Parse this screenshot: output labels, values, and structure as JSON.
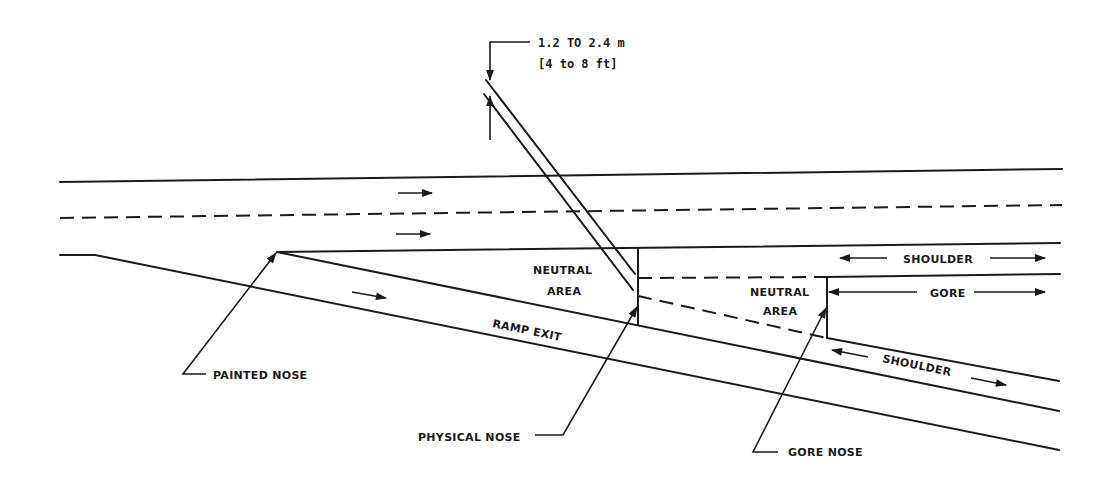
{
  "diagram": {
    "dimension": {
      "metric": "1.2 TO 2.4 m",
      "imperial": "[4 to 8 ft]"
    },
    "labels": {
      "neutral_area_1_line1": "NEUTRAL",
      "neutral_area_1_line2": "AREA",
      "neutral_area_2_line1": "NEUTRAL",
      "neutral_area_2_line2": "AREA",
      "shoulder_top": "SHOULDER",
      "gore": "GORE",
      "ramp_exit": "RAMP EXIT",
      "shoulder_ramp": "SHOULDER"
    },
    "callouts": {
      "painted_nose": "PAINTED NOSE",
      "physical_nose": "PHYSICAL NOSE",
      "gore_nose": "GORE NOSE"
    },
    "colors": {
      "line": "#1a1a1a",
      "background": "#ffffff"
    }
  }
}
